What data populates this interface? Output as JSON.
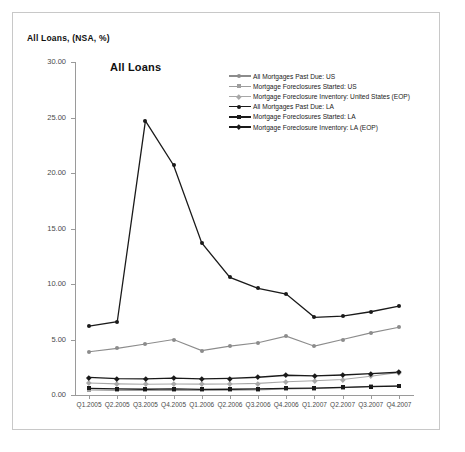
{
  "header": {
    "label": "All Loans, (NSA, %)"
  },
  "chart_data": {
    "type": "line",
    "title": "All Loans",
    "xlabel": "",
    "ylabel": "",
    "ylim": [
      0,
      30
    ],
    "ytick_labels": [
      "0.00",
      "5.00",
      "10.00",
      "15.00",
      "20.00",
      "25.00",
      "30.00"
    ],
    "ytick_values": [
      0,
      5,
      10,
      15,
      20,
      25,
      30
    ],
    "grid": false,
    "legend_position": "top-right",
    "categories": [
      "Q1.2005",
      "Q2.2005",
      "Q3.2005",
      "Q4.2005",
      "Q1.2006",
      "Q2.2006",
      "Q3.2006",
      "Q4.2006",
      "Q1.2007",
      "Q2.2007",
      "Q3.2007",
      "Q4.2007"
    ],
    "series": [
      {
        "name": "All Mortgages Past Due: US",
        "color": "#8c8c8c",
        "marker": "circle",
        "values": [
          3.9,
          4.2,
          4.6,
          5.0,
          4.0,
          4.4,
          4.7,
          5.3,
          4.4,
          5.0,
          5.6,
          6.1
        ]
      },
      {
        "name": "Mortgage Foreclosures Started: US",
        "color": "#9e9e9e",
        "marker": "square",
        "values": [
          0.45,
          0.42,
          0.41,
          0.42,
          0.41,
          0.43,
          0.46,
          0.54,
          0.58,
          0.65,
          0.78,
          0.83
        ]
      },
      {
        "name": "Mortgage Foreclosure Inventory: United States (EOP)",
        "color": "#a8a8a8",
        "marker": "diamond",
        "values": [
          1.08,
          1.0,
          0.97,
          0.99,
          0.98,
          0.99,
          1.05,
          1.19,
          1.28,
          1.4,
          1.69,
          2.04
        ]
      },
      {
        "name": "All Mortgages Past Due: LA",
        "color": "#1a1a1a",
        "marker": "circle",
        "values": [
          6.2,
          6.6,
          24.7,
          20.7,
          13.7,
          10.6,
          9.6,
          9.1,
          7.0,
          7.1,
          7.5,
          8.0
        ]
      },
      {
        "name": "Mortgage Foreclosures Started: LA",
        "color": "#1a1a1a",
        "marker": "square",
        "values": [
          0.6,
          0.55,
          0.52,
          0.55,
          0.5,
          0.52,
          0.55,
          0.6,
          0.62,
          0.68,
          0.75,
          0.8
        ]
      },
      {
        "name": "Mortgage Foreclosure Inventory: LA (EOP)",
        "color": "#1a1a1a",
        "marker": "diamond",
        "values": [
          1.58,
          1.48,
          1.45,
          1.52,
          1.45,
          1.5,
          1.6,
          1.78,
          1.72,
          1.8,
          1.92,
          2.05
        ]
      }
    ]
  }
}
